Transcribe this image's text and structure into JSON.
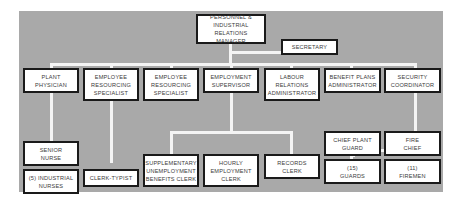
{
  "chart": {
    "nodes": {
      "manager": "PERSONNEL & INDUSTRIAL\nRELATIONS\nMANAGER",
      "secretary": "SECRETARY",
      "plant_physician": "PLANT\nPHYSICIAN",
      "ers_1": "EMPLOYEE\nRESOURCING\nSPECIALIST",
      "ers_2": "EMPLOYEE\nRESOURCING\nSPECIALIST",
      "employment_supervisor": "EMPLOYMENT\nSUPERVISOR",
      "labour_relations": "LABOUR\nRELATIONS\nADMINISTRATOR",
      "benefit_plans": "BENEFIT PLANS\nADMINISTRATOR",
      "security_coordinator": "SECURITY\nCOORDINATOR",
      "senior_nurse": "SENIOR\nNURSE",
      "industrial_nurses": "(5) INDUSTRIAL\nNURSES",
      "clerk_typist": "CLERK-TYPIST",
      "sub_clerk": "SUPPLEMENTARY\nUNEMPLOYMENT\nBENEFITS CLERK",
      "hourly_clerk": "HOURLY\nEMPLOYMENT\nCLERK",
      "records_clerk": "RECORDS\nCLERK",
      "chief_plant_guard": "CHIEF PLANT\nGUARD",
      "fire_chief": "FIRE\nCHIEF",
      "guards": "(15)\nGUARDS",
      "firemen": "(11)\nFIREMEN"
    },
    "colors": {
      "background": "#a9a9a9",
      "connector": "#f4f4f4",
      "box_border": "#1a1a1a"
    }
  }
}
